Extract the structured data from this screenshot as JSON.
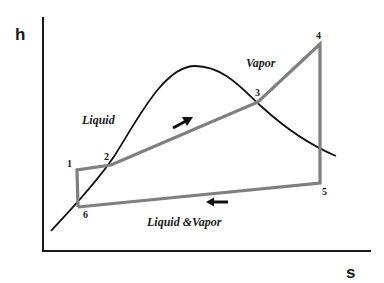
{
  "diagram": {
    "type": "h-s (Mollier) diagram with thermodynamic cycle",
    "axes": {
      "y_label": "h",
      "x_label": "s"
    },
    "regions": {
      "liquid": "Liquid",
      "vapor": "Vapor",
      "mixture": "Liquid &Vapor"
    },
    "points": [
      {
        "id": "1",
        "label": "1",
        "x": 77,
        "y": 170
      },
      {
        "id": "2",
        "label": "2",
        "x": 111,
        "y": 165
      },
      {
        "id": "3",
        "label": "3",
        "x": 258,
        "y": 102
      },
      {
        "id": "4",
        "label": "4",
        "x": 320,
        "y": 44
      },
      {
        "id": "5",
        "label": "5",
        "x": 320,
        "y": 183
      },
      {
        "id": "6",
        "label": "6",
        "x": 78,
        "y": 207
      }
    ],
    "cycle_path": [
      "1",
      "2",
      "3",
      "4",
      "5",
      "6",
      "1"
    ],
    "arrows": [
      {
        "name": "arrow-heating-direction",
        "direction": "up-right"
      },
      {
        "name": "arrow-condensing-direction",
        "direction": "left"
      }
    ],
    "colors": {
      "axis": "#1a1a1a",
      "saturation_curve": "#111111",
      "cycle_line": "#808080",
      "arrow": "#111111",
      "background": "#ffffff"
    }
  }
}
